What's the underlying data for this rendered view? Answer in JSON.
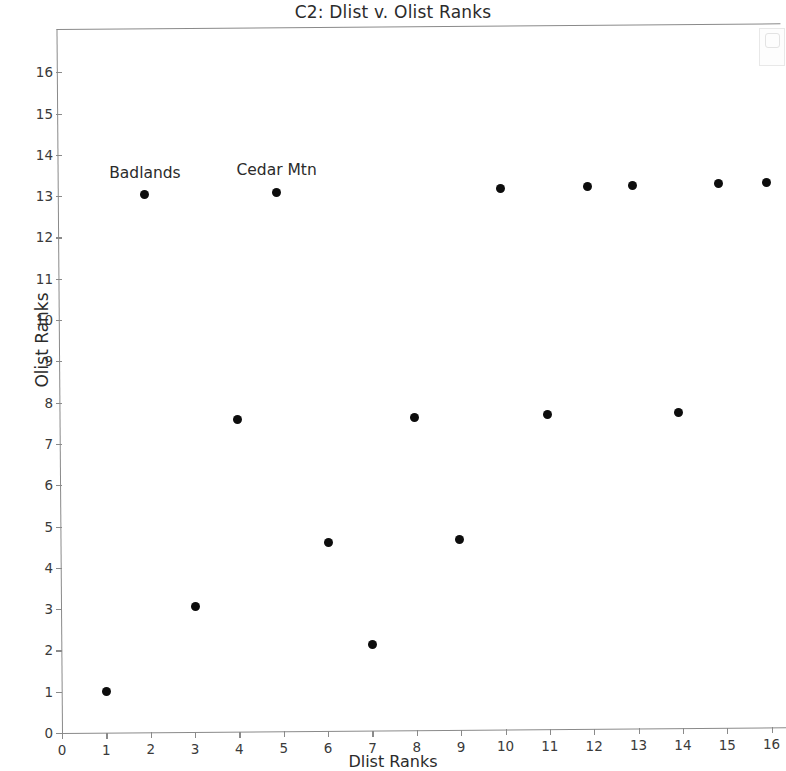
{
  "chart_data": {
    "type": "scatter",
    "title": "C2: Dlist v. Olist Ranks",
    "xlabel": "Dlist Ranks",
    "ylabel": "Olist Ranks",
    "xlim": [
      0,
      16.4
    ],
    "ylim": [
      0,
      16.6
    ],
    "grid": false,
    "legend": "none",
    "xticks": [
      0,
      1,
      2,
      3,
      4,
      5,
      6,
      7,
      8,
      9,
      10,
      11,
      12,
      13,
      14,
      15,
      16
    ],
    "yticks": [
      0,
      1,
      2,
      3,
      4,
      5,
      6,
      7,
      8,
      9,
      10,
      11,
      12,
      13,
      14,
      15,
      16
    ],
    "series": [
      {
        "name": "sites",
        "marker": "filled-circle",
        "color": "#0d0d0d",
        "points": [
          {
            "x": 1.0,
            "y": 1.0
          },
          {
            "x": 1.87,
            "y": 13.02
          },
          {
            "x": 3.0,
            "y": 3.03
          },
          {
            "x": 3.95,
            "y": 7.55
          },
          {
            "x": 4.84,
            "y": 13.05
          },
          {
            "x": 6.0,
            "y": 4.57
          },
          {
            "x": 7.0,
            "y": 2.08
          },
          {
            "x": 7.95,
            "y": 7.58
          },
          {
            "x": 8.97,
            "y": 4.61
          },
          {
            "x": 9.88,
            "y": 13.11
          },
          {
            "x": 10.95,
            "y": 7.62
          },
          {
            "x": 11.85,
            "y": 13.13
          },
          {
            "x": 12.87,
            "y": 13.15
          },
          {
            "x": 13.9,
            "y": 7.65
          },
          {
            "x": 14.8,
            "y": 13.17
          },
          {
            "x": 15.88,
            "y": 13.19
          }
        ]
      }
    ],
    "annotations": [
      {
        "label": "Badlands",
        "x": 1.87,
        "y": 13.02
      },
      {
        "label": "Cedar Mtn",
        "x": 4.84,
        "y": 13.05
      }
    ]
  }
}
